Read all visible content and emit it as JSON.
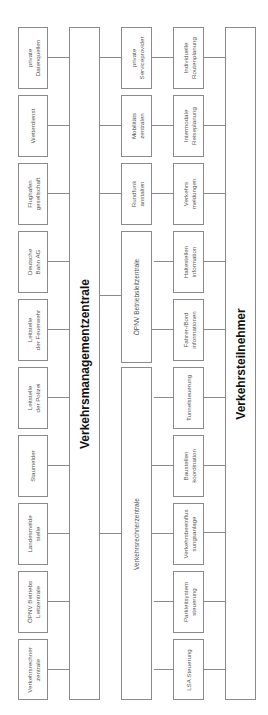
{
  "diagram": {
    "orientation": "rotated 90deg counter-clockwise",
    "top_title": "Verkehrsmanagementzentrale",
    "bottom_title": "Verkehrsteilnehmer",
    "data_sources": [
      "private\nDatenquellen",
      "Wetterdienst",
      "Flughafen\ngesellschaft",
      "Deutsche\nBahn AG",
      "Leitstelle\nder Feuerwehr",
      "Leitstelle\nder Polizei",
      "Staumelder",
      "Landesmelde\nstelle",
      "ÖPNV Betriebs\nLeitzentrale",
      "Verkehrsrechner\nzentrale"
    ],
    "operators": {
      "small": [
        "private\nServiceprovider",
        "Mobilitäts\nzentralen",
        "Rundfunk\nanstalten"
      ],
      "opnv": "ÖPNV Betriebsleitzentrale",
      "vrz": "Verkehrsrechnerzentrale"
    },
    "services": [
      "Individuelle\nRoutenplanung",
      "Intermodale\nReiseplanung",
      "Verkehrs\nmeldungen",
      "Haltestellen\ninformation",
      "Fahrer-/Bord\ninformationen",
      "Tunnelsteuerung",
      "Baustellen\nkoordination",
      "Verkehrsbeeinflus\nsungsanlage",
      "Parkleitsystem\nsteuerung",
      "LSA Steuerung"
    ]
  }
}
